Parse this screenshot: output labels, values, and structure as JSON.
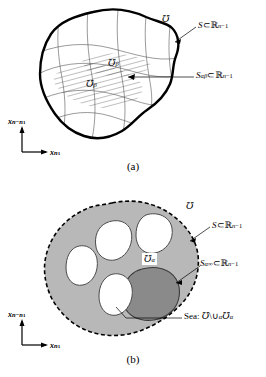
{
  "figure": {
    "type": "math-diagram",
    "panels": [
      {
        "id": "a",
        "caption": "(a)",
        "region_label": "℧",
        "labels": [
          {
            "name": "set-U",
            "text": "℧"
          },
          {
            "name": "boundary-S",
            "base": "S",
            "relation": "⊂",
            "space": "ℝ",
            "exponent": "n−1",
            "text": "S ⊂ ℝⁿ⁻¹"
          },
          {
            "name": "overlap-S-alpha-beta",
            "base": "S",
            "subscript": "αβ",
            "relation": "⊂",
            "space": "ℝ",
            "exponent": "n−1",
            "text": "Sαβ ⊂ ℝⁿ⁻¹"
          },
          {
            "name": "patch-U-beta",
            "base": "℧",
            "subscript": "β"
          },
          {
            "name": "patch-U-alpha",
            "base": "℧",
            "subscript": "β"
          }
        ],
        "axes": {
          "vertical": {
            "bold_symbol": "x",
            "subscript": "n−n₁"
          },
          "horizontal": {
            "bold_symbol": "x",
            "subscript": "n₁"
          }
        }
      },
      {
        "id": "b",
        "caption": "(b)",
        "labels": [
          {
            "name": "set-U",
            "text": "℧"
          },
          {
            "name": "boundary-S",
            "base": "S",
            "relation": "⊂",
            "space": "ℝ",
            "exponent": "n−1",
            "text": "S ⊂ ℝⁿ⁻¹"
          },
          {
            "name": "boundary-S-alpha-infinity",
            "base": "S",
            "subscript": "α∞",
            "relation": "⊂",
            "space": "ℝ",
            "exponent": "n−1",
            "text": "Sα∞ ⊂ ℝⁿ⁻¹"
          },
          {
            "name": "island-U-alpha",
            "base": "℧",
            "subscript": "α"
          },
          {
            "name": "sea-label",
            "prefix": "Sea:",
            "set": "℧",
            "op": "\\",
            "union": "∪",
            "union_sub": "α",
            "patch": "℧",
            "patch_sub": "α",
            "text": "Sea: ℧ \\ ∪α ℧α"
          }
        ],
        "axes": {
          "vertical": {
            "bold_symbol": "x",
            "subscript": "n−n₁"
          },
          "horizontal": {
            "bold_symbol": "x",
            "subscript": "n₁"
          }
        }
      }
    ],
    "colors": {
      "stroke": "#000000",
      "sea_fill": "#b8b8b8",
      "island_dark_fill": "#8a8a8a",
      "hole_fill": "#ffffff",
      "grid_line": "#555555",
      "background": "#ffffff"
    }
  }
}
